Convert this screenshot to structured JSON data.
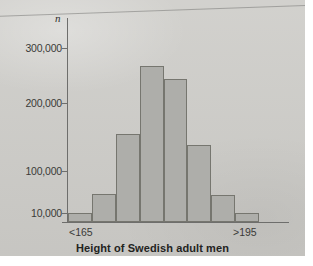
{
  "figure": {
    "background_color": "#cdccc8",
    "page_color": "#ffffff"
  },
  "chart_data": {
    "type": "bar",
    "title": "",
    "xlabel": "Height of Swedish adult men",
    "ylabel": "n",
    "grid": false,
    "legend": null,
    "bar_fill_color": "#aeaeaa",
    "bar_border_color": "#76766f",
    "axis_color": "#6e6e6c",
    "categories": [
      "<165",
      "165-170",
      "170-175",
      "175-180",
      "180-185",
      "185-190",
      "190-195",
      ">195"
    ],
    "values": [
      10000,
      50000,
      155000,
      267000,
      243000,
      138000,
      48000,
      10000
    ],
    "ylim": [
      0,
      330000
    ],
    "ytick_labels": [
      "300,000",
      "200,000",
      "100,000",
      "10,000"
    ],
    "ytick_values": [
      300000,
      200000,
      100000,
      10000
    ],
    "xtick_labels": [
      "<165",
      ">195"
    ],
    "x_axis_low_label": "<165",
    "x_axis_high_label": ">195"
  }
}
